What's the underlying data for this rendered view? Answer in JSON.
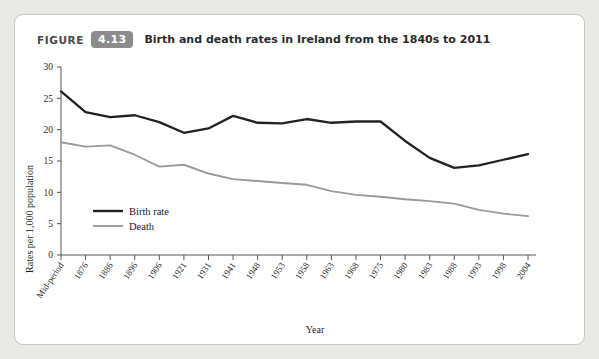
{
  "figure": {
    "label_word": "FIGURE",
    "number": "4.13",
    "title": "Birth and death rates in Ireland from the 1840s to 2011"
  },
  "chart_data": {
    "type": "line",
    "title": "Birth and death rates in Ireland from the 1840s to 2011",
    "xlabel": "Year",
    "ylabel": "Rates per 1,000 population",
    "ylim": [
      0,
      30
    ],
    "yticks": [
      0,
      5,
      10,
      15,
      20,
      25,
      30
    ],
    "grid": false,
    "legend_position": "inside-lower-left",
    "categories": [
      "Mid-period",
      "1876",
      "1886",
      "1896",
      "1906",
      "1921",
      "1931",
      "1941",
      "1948",
      "1953",
      "1958",
      "1963",
      "1968",
      "1975",
      "1980",
      "1983",
      "1988",
      "1993",
      "1998",
      "2004"
    ],
    "series": [
      {
        "name": "Birth rate",
        "color": "#222222",
        "values": [
          26.1,
          22.8,
          22.0,
          22.3,
          21.2,
          19.5,
          20.2,
          22.2,
          21.1,
          21.0,
          21.7,
          21.1,
          21.3,
          21.3,
          18.2,
          15.5,
          13.9,
          14.3,
          15.2,
          16.1
        ]
      },
      {
        "name": "Death",
        "color": "#9a9a9a",
        "values": [
          18.0,
          17.3,
          17.5,
          16.0,
          14.1,
          14.4,
          13.0,
          12.1,
          11.8,
          11.5,
          11.2,
          10.2,
          9.6,
          9.3,
          8.9,
          8.6,
          8.2,
          7.2,
          6.6,
          6.2
        ]
      }
    ]
  }
}
